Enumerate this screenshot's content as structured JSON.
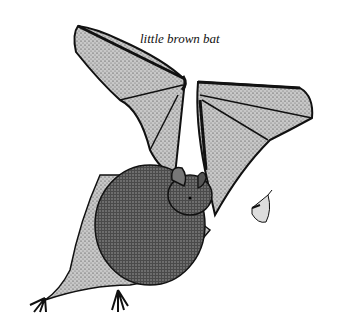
{
  "image": {
    "caption": "little brown bat",
    "subject": "bat-in-flight-illustration",
    "secondary_subject": "moth-insect",
    "style": "black-and-white stipple pen-and-ink",
    "colors": {
      "ink": "#111111",
      "membrane_light": "#bdbdbd",
      "membrane_mid": "#8a8a8a",
      "fur": "#3a3a3a",
      "background": "#ffffff"
    }
  }
}
